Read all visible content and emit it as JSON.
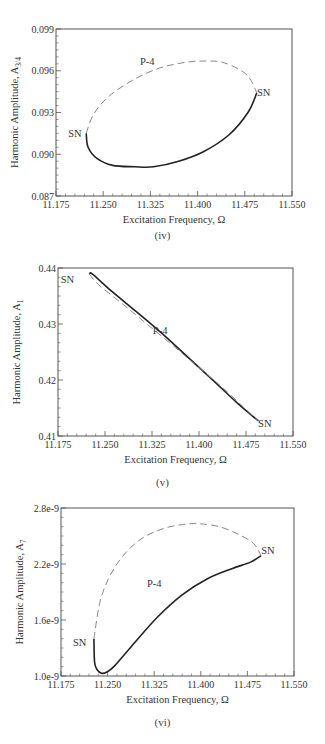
{
  "chart_data": [
    {
      "type": "line",
      "panel_label": "(iv)",
      "xlabel": "Excitation Frequency,  Ω",
      "ylabel": "Harmonic Amplitude, A",
      "ylabel_sub": "3/4",
      "xlim": [
        11.175,
        11.55
      ],
      "ylim": [
        0.087,
        0.099
      ],
      "xticks": [
        "11.175",
        "11.250",
        "11.325",
        "11.400",
        "11.475",
        "11.550"
      ],
      "yticks": [
        "0.087",
        "0.090",
        "0.093",
        "0.096",
        "0.099"
      ],
      "grid": false,
      "series": [
        {
          "name": "stable (solid)",
          "style": "solid",
          "x": [
            11.223,
            11.226,
            11.24,
            11.265,
            11.3,
            11.33,
            11.37,
            11.41,
            11.45,
            11.48,
            11.494
          ],
          "y": [
            0.0915,
            0.0905,
            0.0897,
            0.0892,
            0.0891,
            0.0891,
            0.0895,
            0.0902,
            0.0914,
            0.093,
            0.0944
          ]
        },
        {
          "name": "unstable (dashed)",
          "style": "dashed",
          "x": [
            11.223,
            11.235,
            11.26,
            11.3,
            11.34,
            11.38,
            11.412,
            11.44,
            11.47,
            11.485,
            11.494
          ],
          "y": [
            0.0915,
            0.0929,
            0.0942,
            0.0954,
            0.0962,
            0.0966,
            0.0967,
            0.0966,
            0.096,
            0.0953,
            0.0944
          ]
        }
      ],
      "annotations": [
        {
          "text": "SN",
          "x": 11.205,
          "y": 0.0915
        },
        {
          "text": "SN",
          "x": 11.505,
          "y": 0.0945
        },
        {
          "text": "P-4",
          "x": 11.32,
          "y": 0.0967
        }
      ]
    },
    {
      "type": "line",
      "panel_label": "(v)",
      "xlabel": "Excitation Frequency,  Ω",
      "ylabel": "Harmonic Amplitude, A",
      "ylabel_sub": "1",
      "xlim": [
        11.175,
        11.55
      ],
      "ylim": [
        0.41,
        0.44
      ],
      "xticks": [
        "11.175",
        "11.250",
        "11.325",
        "11.400",
        "11.475",
        "11.550"
      ],
      "yticks": [
        "0.41",
        "0.42",
        "0.43",
        "0.44"
      ],
      "grid": false,
      "series": [
        {
          "name": "stable (solid)",
          "style": "solid",
          "x": [
            11.225,
            11.23,
            11.26,
            11.3,
            11.34,
            11.38,
            11.42,
            11.46,
            11.485,
            11.495
          ],
          "y": [
            0.4389,
            0.4389,
            0.4359,
            0.4322,
            0.4284,
            0.4243,
            0.4202,
            0.416,
            0.4136,
            0.4127
          ]
        },
        {
          "name": "unstable (dashed)",
          "style": "dashed",
          "x": [
            11.225,
            11.24,
            11.28,
            11.32,
            11.36,
            11.4,
            11.44,
            11.48,
            11.495
          ],
          "y": [
            0.4389,
            0.437,
            0.4334,
            0.4297,
            0.426,
            0.4222,
            0.4184,
            0.4142,
            0.4127
          ]
        }
      ],
      "annotations": [
        {
          "text": "SN",
          "x": 11.19,
          "y": 0.438
        },
        {
          "text": "SN",
          "x": 11.505,
          "y": 0.4123
        },
        {
          "text": "P-4",
          "x": 11.338,
          "y": 0.429
        }
      ]
    },
    {
      "type": "line",
      "panel_label": "(vi)",
      "xlabel": "Excitation Frequency,  Ω",
      "ylabel": "Harmonic Amplitude, A",
      "ylabel_sub": "7",
      "xlim": [
        11.175,
        11.55
      ],
      "ylim": [
        1e-09,
        2.8e-09
      ],
      "xticks": [
        "11.175",
        "11.250",
        "11.325",
        "11.400",
        "11.475",
        "11.550"
      ],
      "yticks": [
        "1.0e-9",
        "1.6e-9",
        "2.2e-9",
        "2.8e-9"
      ],
      "grid": false,
      "series": [
        {
          "name": "stable (solid)",
          "style": "solid",
          "x": [
            11.228,
            11.229,
            11.233,
            11.24,
            11.248,
            11.26,
            11.29,
            11.33,
            11.37,
            11.41,
            11.45,
            11.48,
            11.497
          ],
          "y": [
            1.4e-09,
            1.15e-09,
            1.07e-09,
            1.03e-09,
            1.04e-09,
            1.1e-09,
            1.33e-09,
            1.63e-09,
            1.87e-09,
            2.04e-09,
            2.15e-09,
            2.22e-09,
            2.29e-09
          ]
        },
        {
          "name": "unstable (dashed)",
          "style": "dashed",
          "x": [
            11.228,
            11.24,
            11.265,
            11.3,
            11.34,
            11.38,
            11.4,
            11.43,
            11.46,
            11.485,
            11.497
          ],
          "y": [
            1.4e-09,
            1.85e-09,
            2.2e-09,
            2.45e-09,
            2.58e-09,
            2.63e-09,
            2.63e-09,
            2.6e-09,
            2.52e-09,
            2.42e-09,
            2.29e-09
          ]
        }
      ],
      "annotations": [
        {
          "text": "SN",
          "x": 11.205,
          "y": 1.36e-09
        },
        {
          "text": "SN",
          "x": 11.508,
          "y": 2.35e-09
        },
        {
          "text": "P-4",
          "x": 11.325,
          "y": 2e-09
        }
      ]
    }
  ]
}
